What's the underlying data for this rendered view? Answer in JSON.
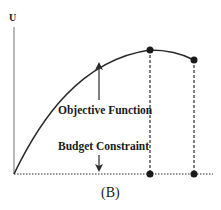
{
  "diagram": {
    "y_axis_label": "U",
    "annotations": {
      "objective_function": "Objective Function",
      "budget_constraint": "Budget Constraint"
    },
    "caption": "(B)",
    "colors": {
      "line": "#2a2a2a",
      "axis": "#888888",
      "text": "#1a1a1a"
    }
  }
}
